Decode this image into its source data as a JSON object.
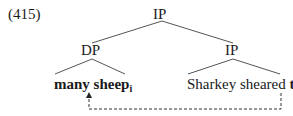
{
  "example_number": "(415)",
  "tree": {
    "root": {
      "label": "IP"
    },
    "left": {
      "label": "DP",
      "leaf": {
        "text": "many sheep",
        "index": "i"
      }
    },
    "right": {
      "label": "IP",
      "leaf": {
        "text": "Sharkey sheared ",
        "trace": "t",
        "index": "i"
      }
    }
  },
  "colors": {
    "line": "#555555",
    "text": "#1a1a1a"
  }
}
